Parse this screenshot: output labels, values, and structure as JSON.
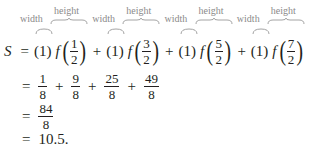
{
  "equation": {
    "lhs": "S",
    "equals": "=",
    "annotations": {
      "width_label": "width",
      "height_label": "height"
    },
    "terms": [
      {
        "width": "(1)",
        "function": "f",
        "numerator": "1",
        "denominator": "2",
        "operator": ""
      },
      {
        "width": "(1)",
        "function": "f",
        "numerator": "3",
        "denominator": "2",
        "operator": "+"
      },
      {
        "width": "(1)",
        "function": "f",
        "numerator": "5",
        "denominator": "2",
        "operator": "+"
      },
      {
        "width": "(1)",
        "function": "f",
        "numerator": "7",
        "denominator": "2",
        "operator": "+"
      }
    ],
    "step2": {
      "equals": "=",
      "fractions": [
        {
          "numerator": "1",
          "denominator": "8"
        },
        {
          "numerator": "9",
          "denominator": "8"
        },
        {
          "numerator": "25",
          "denominator": "8"
        },
        {
          "numerator": "49",
          "denominator": "8"
        }
      ],
      "plus": "+"
    },
    "step3": {
      "equals": "=",
      "numerator": "84",
      "denominator": "8"
    },
    "step4": {
      "equals": "=",
      "value": "10.5."
    },
    "colors": {
      "text": "#231f20",
      "annotation": "#8a8a8a"
    }
  }
}
